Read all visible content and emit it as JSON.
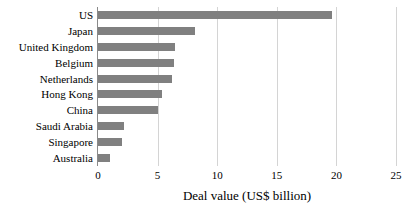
{
  "chart_data": {
    "type": "bar",
    "orientation": "horizontal",
    "title": "",
    "subtitle": "",
    "xlabel": "Deal value (US$ billion)",
    "ylabel": "",
    "categories": [
      "US",
      "Japan",
      "United Kingdom",
      "Belgium",
      "Netherlands",
      "Hong Kong",
      "China",
      "Saudi Arabia",
      "Singapore",
      "Australia"
    ],
    "values": [
      19.6,
      8.1,
      6.5,
      6.4,
      6.2,
      5.4,
      5.0,
      2.2,
      2.0,
      1.0
    ],
    "series": [
      {
        "name": "Deal value",
        "values": [
          19.6,
          8.1,
          6.5,
          6.4,
          6.2,
          5.4,
          5.0,
          2.2,
          2.0,
          1.0
        ]
      }
    ],
    "xlim": [
      0,
      25
    ],
    "xticks": [
      0,
      5,
      10,
      15,
      20,
      25
    ],
    "xtick_labels": [
      "0",
      "5",
      "10",
      "15",
      "20",
      "25"
    ],
    "grid": "vertical",
    "legend": "none",
    "bar_color": "#808080",
    "gridline_color": "#D4D4D4",
    "axis_color": "#8A8A8A",
    "background_color": "#FFFFFF"
  },
  "axis": {
    "x_title": "Deal value (US$ billion)",
    "ticks": [
      {
        "label": "0",
        "value": 0
      },
      {
        "label": "5",
        "value": 5
      },
      {
        "label": "10",
        "value": 10
      },
      {
        "label": "15",
        "value": 15
      },
      {
        "label": "20",
        "value": 20
      },
      {
        "label": "25",
        "value": 25
      }
    ]
  },
  "bars": [
    {
      "label": "US",
      "value": 19.6
    },
    {
      "label": "Japan",
      "value": 8.1
    },
    {
      "label": "United Kingdom",
      "value": 6.5
    },
    {
      "label": "Belgium",
      "value": 6.4
    },
    {
      "label": "Netherlands",
      "value": 6.2
    },
    {
      "label": "Hong Kong",
      "value": 5.4
    },
    {
      "label": "China",
      "value": 5.0
    },
    {
      "label": "Saudi Arabia",
      "value": 2.2
    },
    {
      "label": "Singapore",
      "value": 2.0
    },
    {
      "label": "Australia",
      "value": 1.0
    }
  ]
}
